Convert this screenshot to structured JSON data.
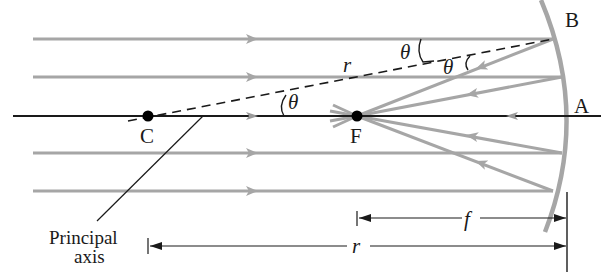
{
  "figure": {
    "colors": {
      "ray": "#a6a6a6",
      "mirror": "#a6a6a6",
      "axis": "#1a1a1a",
      "point": "#000000",
      "dimension": "#1a1a1a"
    }
  },
  "points": {
    "C": {
      "label": "C",
      "desc": "center of curvature"
    },
    "F": {
      "label": "F",
      "desc": "focal point"
    },
    "A": {
      "label": "A",
      "desc": "mirror vertex on principal axis"
    },
    "B": {
      "label": "B",
      "desc": "point of reflection on mirror"
    }
  },
  "labels": {
    "principal_axis_line1": "Principal",
    "principal_axis_line2": "axis",
    "radius_on_line": "r",
    "theta_at_C": "θ",
    "theta_incident": "θ",
    "theta_reflected": "θ"
  },
  "dimensions": {
    "focal_length": {
      "label": "f",
      "from": "F",
      "to": "A"
    },
    "radius": {
      "label": "r",
      "from": "C",
      "to": "A"
    }
  },
  "rays": {
    "count": 5,
    "incoming_direction": "left-to-right, parallel to principal axis",
    "reflected_direction": "toward F"
  }
}
